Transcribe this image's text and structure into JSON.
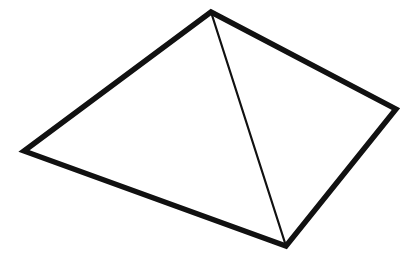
{
  "figure": {
    "canvas": {
      "width": 420,
      "height": 265
    },
    "background_color": "#ffffff",
    "stroke_color": "#111111",
    "outer_stroke_width": 5.4,
    "inner_stroke_width": 2.2,
    "vertices": [
      {
        "name": "apex",
        "label": "A",
        "x": 211,
        "y": 12
      },
      {
        "name": "left",
        "label": "B",
        "x": 24,
        "y": 151
      },
      {
        "name": "bottom",
        "label": "C",
        "x": 286,
        "y": 246
      },
      {
        "name": "right",
        "label": "D",
        "x": 396,
        "y": 109
      }
    ],
    "outline_path": "M 211 12 L 24 151 L 286 246 L 396 109 Z",
    "diagonal_path": "M 211 12 L 286 246",
    "edges": [
      {
        "name": "apex-to-left",
        "from": "apex",
        "to": "left",
        "weight": "thick"
      },
      {
        "name": "left-to-bottom",
        "from": "left",
        "to": "bottom",
        "weight": "thick"
      },
      {
        "name": "bottom-to-right",
        "from": "bottom",
        "to": "right",
        "weight": "thick"
      },
      {
        "name": "right-to-apex",
        "from": "right",
        "to": "apex",
        "weight": "thick"
      },
      {
        "name": "apex-to-bottom-diagonal",
        "from": "apex",
        "to": "bottom",
        "weight": "thin"
      }
    ]
  }
}
